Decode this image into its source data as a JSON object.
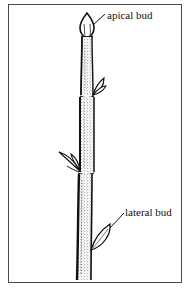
{
  "diagram": {
    "type": "botanical line drawing",
    "labels": {
      "apical_bud": "apical bud",
      "lateral_bud": "lateral bud"
    },
    "colors": {
      "ink": "#111111",
      "border": "#4a4a4a",
      "background": "#ffffff"
    }
  }
}
